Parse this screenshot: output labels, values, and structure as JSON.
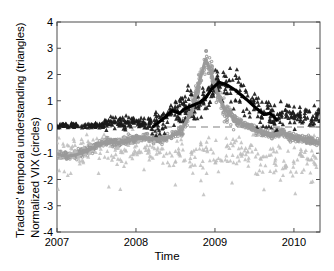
{
  "figure": {
    "axis_labels": {
      "y_line1": "Traders' temporal understanding (triangles)",
      "y_line2": "Normalized VIX  (circles)",
      "x": "Time"
    }
  },
  "chart_data": {
    "type": "scatter",
    "title": "",
    "xlabel": "Time",
    "ylabel": "Traders' temporal understanding (triangles) / Normalized VIX (circles)",
    "xlim": [
      2007.0,
      2010.33
    ],
    "ylim": [
      -4,
      4
    ],
    "xticks": [
      2007,
      2008,
      2009,
      2010
    ],
    "xticklabels": [
      "2007",
      "2008",
      "2009",
      "2010"
    ],
    "yticks": [
      -4,
      -3,
      -2,
      -1,
      0,
      1,
      2,
      3,
      4
    ],
    "yticklabels": [
      "-4",
      "-3",
      "-2",
      "-1",
      "0",
      "1",
      "2",
      "3",
      "4"
    ],
    "grid": false,
    "legend": "none",
    "annotations": [
      {
        "type": "hline",
        "y": 0,
        "style": "dashed",
        "color": "#808080"
      }
    ],
    "colors": {
      "dark_marker": "#1a1a1a",
      "gray_marker": "#9a9a9a",
      "light_gray_marker": "#bdbdbd",
      "dark_trend": "#000000",
      "gray_trend": "#9a9a9a",
      "zero_line": "#808080",
      "axis": "#4d4d4d"
    },
    "series": [
      {
        "name": "Traders' temporal understanding",
        "marker": "triangle",
        "color": "#1a1a1a",
        "description": "Dark triangles, near zero until 2008, rising spread 0.5-3 during 2008.5-2009.5, settling 0-1 by 2010"
      },
      {
        "name": "Traders' temporal understanding (low values)",
        "marker": "triangle",
        "color": "#bdbdbd",
        "description": "Light gray triangles scattered from -3 to 0 across the full span"
      },
      {
        "name": "Normalized VIX",
        "marker": "circle",
        "color": "#9a9a9a",
        "description": "Gray circles dense band near -1 in 2007, rising through 2008 to a spike of 3.5 at end 2008, returning to about -0.5 by 2010"
      },
      {
        "name": "Temporal understanding trend",
        "marker": "line",
        "color": "#000000",
        "x": [
          2008.22,
          2008.36,
          2008.46,
          2008.55,
          2008.62,
          2008.7,
          2008.8,
          2008.88,
          2008.96,
          2009.05,
          2009.14,
          2009.26,
          2009.4,
          2009.52,
          2009.62,
          2009.7,
          2009.78
        ],
        "y": [
          0.02,
          0.35,
          0.62,
          0.52,
          0.7,
          0.8,
          0.92,
          1.1,
          1.45,
          1.7,
          1.62,
          1.4,
          1.05,
          0.72,
          0.48,
          0.52,
          0.28
        ]
      },
      {
        "name": "Normalized VIX trend",
        "marker": "line",
        "color": "#9a9a9a",
        "x": [
          2007.0,
          2007.12,
          2007.25,
          2007.38,
          2007.5,
          2007.62,
          2007.75,
          2007.88,
          2008.0,
          2008.15,
          2008.3,
          2008.45,
          2008.58,
          2008.7,
          2008.8,
          2008.88,
          2008.94,
          2009.02,
          2009.12,
          2009.25,
          2009.4,
          2009.55,
          2009.7,
          2009.85,
          2010.0,
          2010.12,
          2010.25,
          2010.33
        ],
        "y": [
          -1.02,
          -1.12,
          -1.05,
          -0.92,
          -0.72,
          -0.55,
          -0.6,
          -0.52,
          -0.45,
          -0.42,
          -0.48,
          -0.35,
          -0.1,
          0.55,
          1.7,
          2.55,
          2.2,
          1.35,
          0.7,
          0.3,
          0.05,
          -0.15,
          -0.3,
          -0.2,
          -0.42,
          -0.48,
          -0.55,
          -0.62
        ]
      }
    ]
  }
}
